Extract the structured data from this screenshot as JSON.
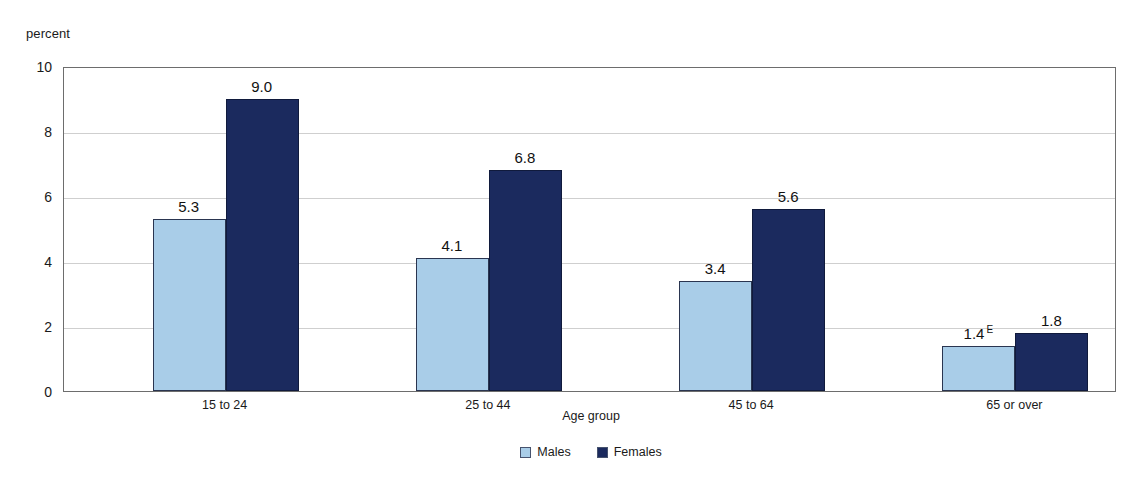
{
  "chart_data": {
    "type": "bar",
    "title": "",
    "subtitle": "",
    "xlabel": "Age group",
    "ylabel": "percent",
    "ylim": [
      0,
      10
    ],
    "yticks": [
      "0",
      "2",
      "4",
      "6",
      "8",
      "10"
    ],
    "grid": true,
    "legend_position": "bottom-center",
    "categories": [
      "15 to 24",
      "25 to 44",
      "45 to 64",
      "65 or over"
    ],
    "series": [
      {
        "name": "Males",
        "color": "#a9cde8",
        "values": [
          5.3,
          4.1,
          3.4,
          1.4
        ],
        "labels": [
          "5.3",
          "4.1",
          "3.4",
          "1.4"
        ],
        "markers": [
          "",
          "",
          "",
          "E"
        ]
      },
      {
        "name": "Females",
        "color": "#1b2a5e",
        "values": [
          9.0,
          6.8,
          5.6,
          1.8
        ],
        "labels": [
          "9.0",
          "6.8",
          "5.6",
          "1.8"
        ],
        "markers": [
          "",
          "",
          "",
          ""
        ]
      }
    ]
  },
  "axes": {
    "y_unit_label": "percent",
    "x_axis_title": "Age group"
  },
  "legend": {
    "items": [
      {
        "label": "Males",
        "color": "#a9cde8"
      },
      {
        "label": "Females",
        "color": "#1b2a5e"
      }
    ]
  },
  "colors": {
    "males": "#a9cde8",
    "females": "#1b2a5e",
    "gridline": "#cfcfcf",
    "axis": "#6d6d6d",
    "background": "#ffffff"
  }
}
